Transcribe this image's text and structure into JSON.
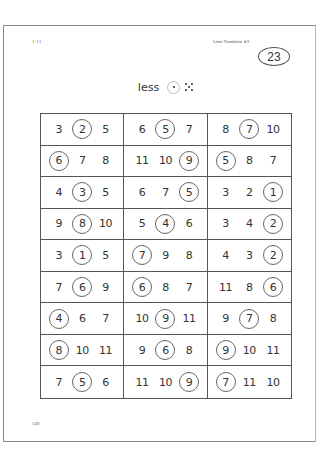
{
  "header": {
    "code": "1-11",
    "title": "Less Numbers #3",
    "page_badge": "23"
  },
  "instruction": {
    "word": "less",
    "circled_die": "one-dot",
    "other_die": "five-dots"
  },
  "grid": {
    "rows": [
      [
        {
          "nums": [
            "3",
            "2",
            "5"
          ],
          "circled": 1
        },
        {
          "nums": [
            "6",
            "5",
            "7"
          ],
          "circled": 1
        },
        {
          "nums": [
            "8",
            "7",
            "10"
          ],
          "circled": 1
        }
      ],
      [
        {
          "nums": [
            "6",
            "7",
            "8"
          ],
          "circled": 0
        },
        {
          "nums": [
            "11",
            "10",
            "9"
          ],
          "circled": 2
        },
        {
          "nums": [
            "5",
            "8",
            "7"
          ],
          "circled": 0
        }
      ],
      [
        {
          "nums": [
            "4",
            "3",
            "5"
          ],
          "circled": 1
        },
        {
          "nums": [
            "6",
            "7",
            "5"
          ],
          "circled": 2
        },
        {
          "nums": [
            "3",
            "2",
            "1"
          ],
          "circled": 2
        }
      ],
      [
        {
          "nums": [
            "9",
            "8",
            "10"
          ],
          "circled": 1
        },
        {
          "nums": [
            "5",
            "4",
            "6"
          ],
          "circled": 1
        },
        {
          "nums": [
            "3",
            "4",
            "2"
          ],
          "circled": 2
        }
      ],
      [
        {
          "nums": [
            "3",
            "1",
            "5"
          ],
          "circled": 1
        },
        {
          "nums": [
            "7",
            "9",
            "8"
          ],
          "circled": 0
        },
        {
          "nums": [
            "4",
            "3",
            "2"
          ],
          "circled": 2
        }
      ],
      [
        {
          "nums": [
            "7",
            "6",
            "9"
          ],
          "circled": 1
        },
        {
          "nums": [
            "6",
            "8",
            "7"
          ],
          "circled": 0
        },
        {
          "nums": [
            "11",
            "8",
            "6"
          ],
          "circled": 2
        }
      ],
      [
        {
          "nums": [
            "4",
            "6",
            "7"
          ],
          "circled": 0
        },
        {
          "nums": [
            "10",
            "9",
            "11"
          ],
          "circled": 1
        },
        {
          "nums": [
            "9",
            "7",
            "8"
          ],
          "circled": 1
        }
      ],
      [
        {
          "nums": [
            "8",
            "10",
            "11"
          ],
          "circled": 0
        },
        {
          "nums": [
            "9",
            "6",
            "8"
          ],
          "circled": 1
        },
        {
          "nums": [
            "9",
            "10",
            "11"
          ],
          "circled": 0
        }
      ],
      [
        {
          "nums": [
            "7",
            "5",
            "6"
          ],
          "circled": 1
        },
        {
          "nums": [
            "11",
            "10",
            "9"
          ],
          "circled": 2
        },
        {
          "nums": [
            "7",
            "11",
            "10"
          ],
          "circled": 0
        }
      ]
    ]
  },
  "footer": {
    "page_number": "148"
  }
}
